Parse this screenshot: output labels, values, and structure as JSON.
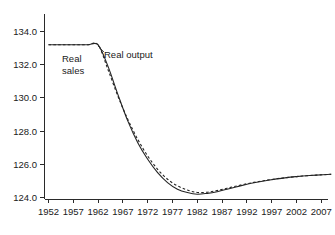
{
  "chart_data": {
    "type": "line",
    "title": "",
    "subtitle": "",
    "xlabel": "",
    "ylabel": "",
    "xlim": [
      1952,
      2009
    ],
    "ylim": [
      123.4,
      134.8
    ],
    "grid": false,
    "legend_position": "inline-annotations",
    "x_ticks": [
      1952,
      1957,
      1962,
      1967,
      1972,
      1977,
      1982,
      1987,
      1992,
      1997,
      2002,
      2007
    ],
    "x_tick_labels": [
      "1952",
      "1957",
      "1962",
      "1967",
      "1972",
      "1977",
      "1982",
      "1987",
      "1992",
      "1997",
      "2002",
      "2007"
    ],
    "y_ticks": [
      124.0,
      126.0,
      128.0,
      130.0,
      132.0,
      134.0
    ],
    "y_tick_labels": [
      "124.0",
      "126.0",
      "128.0",
      "130.0",
      "132.0",
      "134.0"
    ],
    "x": [
      1952,
      1954,
      1956,
      1958,
      1960,
      1962,
      1964,
      1966,
      1968,
      1970,
      1972,
      1974,
      1976,
      1978,
      1980,
      1982,
      1984,
      1986,
      1988,
      1990,
      1992,
      1994,
      1996,
      1998,
      2000,
      2002,
      2004,
      2006,
      2009
    ],
    "series": [
      {
        "name": "Real output",
        "style": "solid",
        "color": "#242424",
        "values": [
          133.2,
          133.2,
          133.2,
          133.2,
          133.2,
          133.2,
          131.9,
          130.2,
          128.6,
          127.3,
          126.3,
          125.5,
          124.9,
          124.5,
          124.3,
          124.2,
          124.25,
          124.35,
          124.5,
          124.65,
          124.8,
          124.92,
          125.02,
          125.12,
          125.2,
          125.26,
          125.31,
          125.35,
          125.4
        ]
      },
      {
        "name": "Real sales",
        "style": "dashed",
        "color": "#242424",
        "values": [
          133.2,
          133.2,
          133.2,
          133.2,
          133.2,
          133.2,
          131.7,
          130.1,
          128.7,
          127.5,
          126.5,
          125.7,
          125.1,
          124.7,
          124.45,
          124.3,
          124.32,
          124.42,
          124.56,
          124.7,
          124.83,
          124.94,
          125.04,
          125.13,
          125.2,
          125.26,
          125.31,
          125.35,
          125.4
        ]
      }
    ],
    "annotations": [
      {
        "id": "real-sales-label",
        "text_lines": [
          "Real",
          "sales"
        ],
        "target_series": "Real sales"
      },
      {
        "id": "real-output-label",
        "text_lines": [
          "Real output"
        ],
        "target_series": "Real output"
      }
    ]
  },
  "labels": {
    "real_sales_line1": "Real",
    "real_sales_line2": "sales",
    "real_output": "Real output"
  },
  "ytick": {
    "t0": "124.0",
    "t1": "126.0",
    "t2": "128.0",
    "t3": "130.0",
    "t4": "132.0",
    "t5": "134.0"
  },
  "xtick": {
    "t0": "1952",
    "t1": "1957",
    "t2": "1962",
    "t3": "1967",
    "t4": "1972",
    "t5": "1977",
    "t6": "1982",
    "t7": "1987",
    "t8": "1992",
    "t9": "1997",
    "t10": "2002",
    "t11": "2007"
  }
}
